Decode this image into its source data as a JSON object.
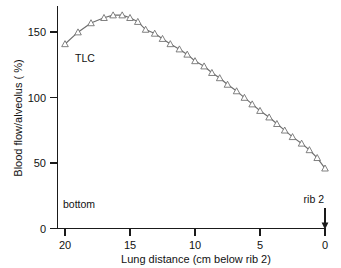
{
  "figure": {
    "background_color": "#ffffff",
    "line_color": "#6e6e6e",
    "axis_color": "#1a1a1a",
    "marker_fill": "#ffffff"
  },
  "chart_data": {
    "type": "line",
    "title": "",
    "xlabel": "Lung distance (cm below rib 2)",
    "ylabel": "Blood flow/alveolus ( %)",
    "xlim": [
      20,
      0
    ],
    "ylim": [
      0,
      170
    ],
    "x_axis_reversed": true,
    "grid": false,
    "legend": "none",
    "xticks": [
      20,
      15,
      10,
      5,
      0
    ],
    "xticklabels": [
      "20",
      "15",
      "10",
      "5",
      "0"
    ],
    "yticks": [
      0,
      50,
      100,
      150
    ],
    "yticklabels": [
      "0",
      "50",
      "100",
      "150"
    ],
    "marker": "open-triangle-up",
    "series": [
      {
        "name": "TLC",
        "x": [
          20.0,
          19.0,
          18.0,
          17.0,
          16.3,
          15.6,
          15.0,
          14.4,
          13.8,
          13.1,
          12.5,
          11.9,
          11.2,
          10.6,
          10.0,
          9.3,
          8.7,
          8.1,
          7.5,
          6.8,
          6.2,
          5.6,
          5.0,
          4.3,
          3.7,
          3.1,
          2.5,
          1.8,
          1.2,
          0.6,
          0.0
        ],
        "y": [
          141,
          150,
          157,
          161,
          163,
          163,
          161,
          158,
          152,
          149,
          145,
          141,
          137,
          133,
          128,
          124,
          119,
          115,
          110,
          105,
          100,
          95,
          90,
          85,
          80,
          75,
          70,
          65,
          60,
          54,
          46
        ]
      }
    ],
    "annotations": [
      {
        "text": "TLC",
        "x_value": 18.6,
        "y_value": 138,
        "name": "tlc-label"
      },
      {
        "text": "bottom",
        "x_value": 19.2,
        "y_value": 25,
        "name": "bottom-label"
      },
      {
        "text": "rib 2",
        "x_value": 0.9,
        "y_value": 27,
        "name": "rib2-label"
      }
    ],
    "pointer": {
      "name": "rib2-arrow",
      "x_value": 0,
      "points_to": "x-axis-zero"
    }
  }
}
